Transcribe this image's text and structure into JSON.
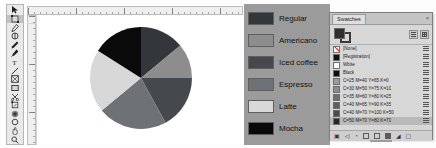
{
  "app": {
    "window_title": "Swatches",
    "artboard_background": "#ffffff"
  },
  "toolbar": {
    "name": "tools-palette",
    "tools": [
      {
        "id": "selection-tool",
        "label": "Selection",
        "icon": "cursor-arrow-icon",
        "selected": false
      },
      {
        "id": "direct-selection-tool",
        "label": "Direct Selection",
        "icon": "page-tool-icon",
        "selected": true
      },
      {
        "id": "pen-tool",
        "label": "Pen",
        "icon": "pen-nib-icon",
        "selected": false
      },
      {
        "id": "gap-tool",
        "label": "Gap",
        "icon": "gap-icon",
        "selected": false
      },
      {
        "id": "pencil-tool",
        "label": "Pencil",
        "icon": "pencil-icon",
        "selected": false
      },
      {
        "id": "eyedropper-tool",
        "label": "Eyedropper",
        "icon": "eyedropper-icon",
        "selected": false
      },
      {
        "id": "type-tool",
        "label": "Type",
        "icon": "type-t-icon",
        "selected": false
      },
      {
        "id": "line-tool",
        "label": "Line",
        "icon": "line-diagonal-icon",
        "selected": false
      },
      {
        "id": "rectangle-frame-tool",
        "label": "Rectangle Frame",
        "icon": "frame-box-icon",
        "selected": false
      },
      {
        "id": "rectangle-tool",
        "label": "Rectangle",
        "icon": "rectangle-icon",
        "selected": false
      },
      {
        "id": "scissors-tool",
        "label": "Scissors",
        "icon": "scissors-icon",
        "selected": false
      },
      {
        "id": "free-transform-tool",
        "label": "Free Transform",
        "icon": "transform-icon",
        "selected": false
      },
      {
        "id": "gradient-swatch-tool",
        "label": "Gradient Swatch",
        "icon": "gradient-circle-icon",
        "selected": false
      },
      {
        "id": "note-tool",
        "label": "Note",
        "icon": "note-icon",
        "selected": false
      },
      {
        "id": "hand-tool",
        "label": "Hand",
        "icon": "hand-icon",
        "selected": false
      },
      {
        "id": "zoom-tool",
        "label": "Zoom",
        "icon": "magnifier-icon",
        "selected": false
      }
    ]
  },
  "rulers": {
    "horizontal_name": "horizontal-ruler",
    "vertical_name": "vertical-ruler"
  },
  "chart_data": {
    "type": "pie",
    "title": "",
    "categories": [
      "Regular",
      "Americano",
      "Iced coffee",
      "Espresso",
      "Latte",
      "Mocha"
    ],
    "values": [
      14,
      11,
      17,
      22,
      20,
      16
    ],
    "colors": [
      "#33373c",
      "#8d8d8d",
      "#45484c",
      "#6e7175",
      "#d8d8d8",
      "#0a0a0a"
    ],
    "legend_position": "right",
    "grid": false
  },
  "legend": {
    "name": "chart-legend",
    "background": "#9b9b9b",
    "items": [
      {
        "label": "Regular",
        "color": "#33373c"
      },
      {
        "label": "Americano",
        "color": "#8d8d8d"
      },
      {
        "label": "Iced coffee",
        "color": "#45484c"
      },
      {
        "label": "Espresso",
        "color": "#6e7175"
      },
      {
        "label": "Latte",
        "color": "#d8d8d8"
      },
      {
        "label": "Mocha",
        "color": "#0a0a0a"
      }
    ]
  },
  "swatches_panel": {
    "tab_label": "Swatches",
    "close_label": "×",
    "fill_color": "#2f2f2f",
    "stroke_color": "#3a3a3a",
    "view_buttons": [
      {
        "name": "list-view-button",
        "label": "List View"
      },
      {
        "name": "grid-view-button",
        "label": "Grid View"
      }
    ],
    "swatches": [
      {
        "name": "[None]",
        "color": "none",
        "selected": false
      },
      {
        "name": "[Registration]",
        "color": "#121212",
        "selected": false
      },
      {
        "name": "Wbite",
        "color": "#ffffff",
        "selected": false
      },
      {
        "name": "Black",
        "color": "#0d0d0d",
        "selected": false
      },
      {
        "name": "C=25 M=40 Y=65 K=0",
        "color": "#9a9a9a",
        "selected": false
      },
      {
        "name": "C=30 M=50 Y=75 K=10",
        "color": "#8b8b8b",
        "selected": false
      },
      {
        "name": "C=35 M=60 Y=80 K=25",
        "color": "#6f6f6f",
        "selected": false
      },
      {
        "name": "C=40 M=65 Y=90 K=35",
        "color": "#5e5e5e",
        "selected": false
      },
      {
        "name": "C=40 M=70 Y=100 K=50",
        "color": "#4a4a4a",
        "selected": false
      },
      {
        "name": "C=50 M=70 Y=80 K=70",
        "color": "#272727",
        "selected": true
      }
    ],
    "footer_buttons": [
      {
        "name": "show-all-swatches-button",
        "icon": "swatch-all-icon",
        "label": "Show All Swatches"
      },
      {
        "name": "show-color-swatches-button",
        "icon": "color-group-icon",
        "label": "Show Color Swatches"
      },
      {
        "name": "show-gradient-swatches-button",
        "icon": "gradient-icon",
        "label": "Show Gradient Swatches"
      },
      {
        "name": "new-color-group-button",
        "icon": "folder-icon",
        "label": "New Color Group"
      },
      {
        "name": "new-swatch-button",
        "icon": "new-page-icon",
        "label": "New Swatch"
      },
      {
        "name": "delete-swatch-button",
        "icon": "trash-icon",
        "label": "Delete Swatch"
      }
    ]
  }
}
